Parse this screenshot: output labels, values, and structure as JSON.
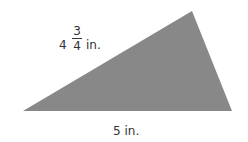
{
  "figure": {
    "shape": "triangle",
    "fill_color": "#888888",
    "vertices": [
      [
        23,
        111
      ],
      [
        192,
        11
      ],
      [
        232,
        111
      ]
    ],
    "side_left": {
      "whole": "4",
      "numerator": "3",
      "denominator": "4",
      "unit": "in."
    },
    "side_bottom": {
      "label": "5 in."
    }
  }
}
